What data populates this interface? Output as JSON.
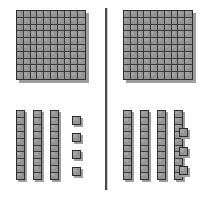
{
  "image": {
    "title": "Base ten blocks comparison",
    "background_color": "#ffffff",
    "block_fill_color": "#949494",
    "block_edge_color": "#2e2e2e",
    "shadow_color": "#9e9e9e"
  },
  "divider": {
    "name": "vertical-divider",
    "orientation": "vertical",
    "color": "#4a4a4a"
  },
  "panels": [
    {
      "side": "left",
      "flats": 1,
      "rods": 3,
      "units": 4,
      "flat_rows": 10,
      "flat_cols": 10,
      "rod_segments": 10,
      "hundreds_value": 100,
      "tens_value": 30,
      "ones_value": 4,
      "total_value": 134
    },
    {
      "side": "right",
      "flats": 1,
      "rods": 4,
      "units": 3,
      "flat_rows": 10,
      "flat_cols": 10,
      "rod_segments": 10,
      "hundreds_value": 100,
      "tens_value": 40,
      "ones_value": 3,
      "total_value": 143
    }
  ]
}
